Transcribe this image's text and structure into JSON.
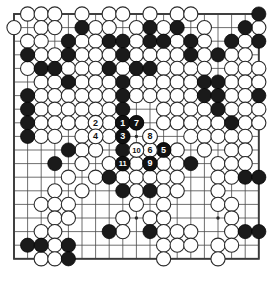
{
  "diagram": {
    "kind": "go-board-diagram",
    "board_size": 19,
    "background_color": "#ffffff",
    "line_color": "#4a4a4a",
    "border_color": "#3a3a3a",
    "black_color": "#1a1a1a",
    "white_color": "#ffffff",
    "geometry": {
      "origin_x": 14,
      "origin_y": 14,
      "spacing": 13.6,
      "stone_radius": 7.1,
      "move_radius": 7.4,
      "move_font_size": 9
    },
    "star_points": [
      [
        3,
        3
      ],
      [
        9,
        3
      ],
      [
        15,
        3
      ],
      [
        3,
        9
      ],
      [
        9,
        9
      ],
      [
        15,
        9
      ],
      [
        3,
        15
      ],
      [
        9,
        15
      ],
      [
        15,
        15
      ]
    ],
    "stones": {
      "black": [
        [
          18,
          0
        ],
        [
          19,
          0
        ],
        [
          12,
          1
        ],
        [
          5,
          1
        ],
        [
          10,
          1
        ],
        [
          17,
          1
        ],
        [
          19,
          1
        ],
        [
          4,
          2
        ],
        [
          7,
          2
        ],
        [
          8,
          2
        ],
        [
          10,
          2
        ],
        [
          11,
          2
        ],
        [
          13,
          2
        ],
        [
          16,
          2
        ],
        [
          18,
          2
        ],
        [
          19,
          2
        ],
        [
          1,
          3
        ],
        [
          4,
          3
        ],
        [
          8,
          3
        ],
        [
          13,
          3
        ],
        [
          15,
          3
        ],
        [
          2,
          4
        ],
        [
          3,
          4
        ],
        [
          7,
          4
        ],
        [
          9,
          4
        ],
        [
          10,
          4
        ],
        [
          4,
          5
        ],
        [
          8,
          5
        ],
        [
          14,
          5
        ],
        [
          15,
          5
        ],
        [
          19,
          5
        ],
        [
          1,
          6
        ],
        [
          8,
          6
        ],
        [
          14,
          6
        ],
        [
          15,
          6
        ],
        [
          18,
          6
        ],
        [
          20,
          6
        ],
        [
          1,
          7
        ],
        [
          8,
          7
        ],
        [
          15,
          7
        ],
        [
          1,
          8
        ],
        [
          9,
          8
        ],
        [
          16,
          8
        ],
        [
          1,
          9
        ],
        [
          4,
          10
        ],
        [
          8,
          10
        ],
        [
          3,
          11
        ],
        [
          13,
          11
        ],
        [
          7,
          12
        ],
        [
          17,
          12
        ],
        [
          18,
          12
        ],
        [
          19,
          12
        ],
        [
          20,
          12
        ],
        [
          8,
          13
        ],
        [
          10,
          13
        ],
        [
          19,
          14
        ],
        [
          7,
          16
        ],
        [
          10,
          16
        ],
        [
          17,
          16
        ],
        [
          18,
          16
        ],
        [
          1,
          17
        ],
        [
          2,
          17
        ],
        [
          4,
          17
        ],
        [
          4,
          18
        ]
      ],
      "white": [
        [
          1,
          0
        ],
        [
          2,
          0
        ],
        [
          3,
          0
        ],
        [
          5,
          0
        ],
        [
          7,
          0
        ],
        [
          8,
          0
        ],
        [
          10,
          0
        ],
        [
          12,
          0
        ],
        [
          13,
          0
        ],
        [
          0,
          1
        ],
        [
          2,
          1
        ],
        [
          3,
          1
        ],
        [
          6,
          1
        ],
        [
          7,
          1
        ],
        [
          9,
          1
        ],
        [
          11,
          1
        ],
        [
          14,
          1
        ],
        [
          18,
          1
        ],
        [
          1,
          2
        ],
        [
          2,
          2
        ],
        [
          5,
          2
        ],
        [
          6,
          2
        ],
        [
          9,
          2
        ],
        [
          12,
          2
        ],
        [
          14,
          2
        ],
        [
          17,
          2
        ],
        [
          2,
          3
        ],
        [
          3,
          3
        ],
        [
          5,
          3
        ],
        [
          6,
          3
        ],
        [
          7,
          3
        ],
        [
          9,
          3
        ],
        [
          10,
          3
        ],
        [
          11,
          3
        ],
        [
          12,
          3
        ],
        [
          14,
          3
        ],
        [
          16,
          3
        ],
        [
          17,
          3
        ],
        [
          19,
          3
        ],
        [
          1,
          4
        ],
        [
          4,
          4
        ],
        [
          5,
          4
        ],
        [
          6,
          4
        ],
        [
          8,
          4
        ],
        [
          11,
          4
        ],
        [
          12,
          4
        ],
        [
          13,
          4
        ],
        [
          14,
          4
        ],
        [
          16,
          4
        ],
        [
          17,
          4
        ],
        [
          18,
          4
        ],
        [
          2,
          5
        ],
        [
          3,
          5
        ],
        [
          5,
          5
        ],
        [
          6,
          5
        ],
        [
          7,
          5
        ],
        [
          9,
          5
        ],
        [
          10,
          5
        ],
        [
          11,
          5
        ],
        [
          12,
          5
        ],
        [
          13,
          5
        ],
        [
          16,
          5
        ],
        [
          17,
          5
        ],
        [
          18,
          5
        ],
        [
          2,
          6
        ],
        [
          3,
          6
        ],
        [
          4,
          6
        ],
        [
          5,
          6
        ],
        [
          6,
          6
        ],
        [
          7,
          6
        ],
        [
          9,
          6
        ],
        [
          10,
          6
        ],
        [
          11,
          6
        ],
        [
          12,
          6
        ],
        [
          13,
          6
        ],
        [
          16,
          6
        ],
        [
          17,
          6
        ],
        [
          19,
          6
        ],
        [
          2,
          7
        ],
        [
          3,
          7
        ],
        [
          4,
          7
        ],
        [
          5,
          7
        ],
        [
          6,
          7
        ],
        [
          7,
          7
        ],
        [
          11,
          7
        ],
        [
          12,
          7
        ],
        [
          13,
          7
        ],
        [
          14,
          7
        ],
        [
          16,
          7
        ],
        [
          17,
          7
        ],
        [
          18,
          7
        ],
        [
          19,
          7
        ],
        [
          2,
          8
        ],
        [
          3,
          8
        ],
        [
          4,
          8
        ],
        [
          5,
          8
        ],
        [
          6,
          8
        ],
        [
          7,
          8
        ],
        [
          8,
          8
        ],
        [
          11,
          8
        ],
        [
          12,
          8
        ],
        [
          13,
          8
        ],
        [
          14,
          8
        ],
        [
          15,
          8
        ],
        [
          17,
          8
        ],
        [
          18,
          8
        ],
        [
          2,
          9
        ],
        [
          3,
          9
        ],
        [
          5,
          9
        ],
        [
          6,
          9
        ],
        [
          7,
          9
        ],
        [
          10,
          9
        ],
        [
          13,
          9
        ],
        [
          14,
          9
        ],
        [
          15,
          9
        ],
        [
          16,
          9
        ],
        [
          17,
          9
        ],
        [
          5,
          10
        ],
        [
          6,
          10
        ],
        [
          9,
          10
        ],
        [
          10,
          10
        ],
        [
          11,
          10
        ],
        [
          12,
          10
        ],
        [
          14,
          10
        ],
        [
          16,
          10
        ],
        [
          17,
          10
        ],
        [
          5,
          11
        ],
        [
          7,
          11
        ],
        [
          9,
          11
        ],
        [
          10,
          11
        ],
        [
          11,
          11
        ],
        [
          12,
          11
        ],
        [
          15,
          11
        ],
        [
          16,
          11
        ],
        [
          17,
          11
        ],
        [
          4,
          12
        ],
        [
          6,
          12
        ],
        [
          8,
          12
        ],
        [
          9,
          12
        ],
        [
          10,
          12
        ],
        [
          11,
          12
        ],
        [
          12,
          12
        ],
        [
          15,
          12
        ],
        [
          16,
          12
        ],
        [
          3,
          13
        ],
        [
          5,
          13
        ],
        [
          9,
          13
        ],
        [
          11,
          13
        ],
        [
          12,
          13
        ],
        [
          15,
          13
        ],
        [
          2,
          14
        ],
        [
          3,
          14
        ],
        [
          4,
          14
        ],
        [
          9,
          14
        ],
        [
          11,
          14
        ],
        [
          15,
          14
        ],
        [
          16,
          14
        ],
        [
          3,
          15
        ],
        [
          4,
          15
        ],
        [
          8,
          15
        ],
        [
          10,
          15
        ],
        [
          11,
          15
        ],
        [
          16,
          15
        ],
        [
          2,
          16
        ],
        [
          3,
          16
        ],
        [
          8,
          16
        ],
        [
          11,
          16
        ],
        [
          12,
          16
        ],
        [
          13,
          16
        ],
        [
          16,
          16
        ],
        [
          3,
          17
        ],
        [
          11,
          17
        ],
        [
          12,
          17
        ],
        [
          13,
          17
        ],
        [
          15,
          17
        ],
        [
          16,
          17
        ],
        [
          2,
          18
        ],
        [
          3,
          18
        ],
        [
          11,
          18
        ],
        [
          15,
          18
        ]
      ]
    },
    "moves": [
      {
        "number": "1",
        "color": "black",
        "col": 8,
        "row": 8
      },
      {
        "number": "2",
        "color": "white",
        "col": 6,
        "row": 8
      },
      {
        "number": "3",
        "color": "black",
        "col": 8,
        "row": 9
      },
      {
        "number": "4",
        "color": "white",
        "col": 6,
        "row": 9
      },
      {
        "number": "5",
        "color": "black",
        "col": 11,
        "row": 10
      },
      {
        "number": "6",
        "color": "white",
        "col": 10,
        "row": 10
      },
      {
        "number": "7",
        "color": "black",
        "col": 9,
        "row": 8
      },
      {
        "number": "8",
        "color": "white",
        "col": 10,
        "row": 9
      },
      {
        "number": "9",
        "color": "black",
        "col": 10,
        "row": 11
      },
      {
        "number": "10",
        "color": "white",
        "col": 9,
        "row": 10
      },
      {
        "number": "11",
        "color": "black",
        "col": 8,
        "row": 11
      }
    ]
  }
}
